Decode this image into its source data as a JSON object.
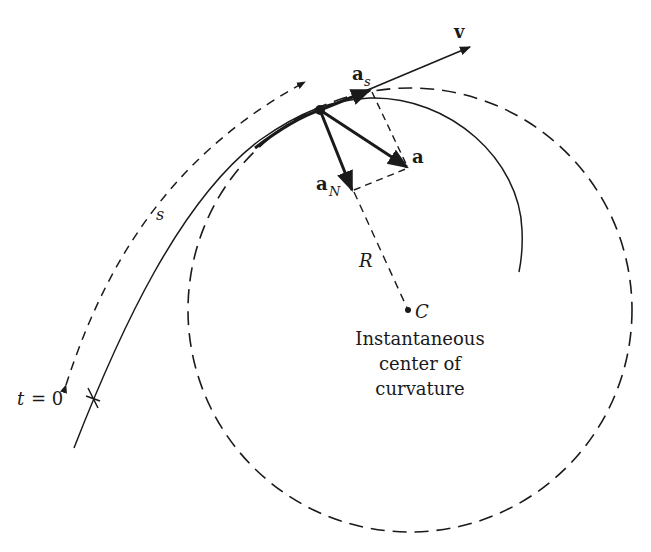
{
  "diagram": {
    "labels": {
      "velocity": "v",
      "tangential_accel": "a",
      "tangential_sub": "s",
      "accel": "a",
      "normal_accel": "a",
      "normal_sub": "N",
      "radius": "R",
      "center": "C",
      "arc_length": "s",
      "t_label": "t",
      "t_eq": "= 0",
      "center_caption_1": "Instantaneous",
      "center_caption_2": "center of",
      "center_caption_3": "curvature"
    },
    "colors": {
      "ink": "#1a1a1a",
      "background": "#ffffff"
    }
  }
}
